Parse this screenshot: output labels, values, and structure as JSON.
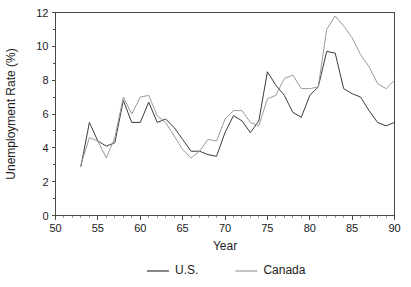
{
  "chart_data": {
    "type": "line",
    "title": "",
    "xlabel": "Year",
    "ylabel": "Unemployment Rate (%)",
    "xlim": [
      50,
      90
    ],
    "ylim": [
      0,
      12
    ],
    "xticks": [
      50,
      55,
      60,
      65,
      70,
      75,
      80,
      85,
      90
    ],
    "yticks": [
      0,
      2,
      4,
      6,
      8,
      10,
      12
    ],
    "yticks_minor": [
      1,
      3,
      5,
      7,
      9,
      11
    ],
    "grid": false,
    "legend_position": "below",
    "x": [
      53,
      54,
      55,
      56,
      57,
      58,
      59,
      60,
      61,
      62,
      63,
      64,
      65,
      66,
      67,
      68,
      69,
      70,
      71,
      72,
      73,
      74,
      75,
      76,
      77,
      78,
      79,
      80,
      81,
      82,
      83,
      84,
      85,
      86,
      87,
      88,
      89,
      90
    ],
    "series": [
      {
        "name": "U.S.",
        "color": "#3b3b3b",
        "values": [
          2.9,
          5.5,
          4.4,
          4.1,
          4.3,
          6.8,
          5.5,
          5.5,
          6.7,
          5.5,
          5.7,
          5.2,
          4.5,
          3.8,
          3.8,
          3.6,
          3.5,
          4.9,
          5.9,
          5.6,
          4.9,
          5.6,
          8.5,
          7.7,
          7.1,
          6.1,
          5.8,
          7.1,
          7.6,
          9.7,
          9.6,
          7.5,
          7.2,
          7.0,
          6.2,
          5.5,
          5.3,
          5.5
        ]
      },
      {
        "name": "Canada",
        "color": "#9a9a9a",
        "values": [
          3.0,
          4.6,
          4.4,
          3.4,
          4.6,
          7.0,
          6.0,
          7.0,
          7.1,
          5.9,
          5.5,
          4.7,
          3.9,
          3.4,
          3.8,
          4.5,
          4.4,
          5.7,
          6.2,
          6.2,
          5.5,
          5.3,
          6.9,
          7.1,
          8.1,
          8.3,
          7.5,
          7.5,
          7.6,
          11.0,
          11.8,
          11.2,
          10.5,
          9.5,
          8.8,
          7.8,
          7.5,
          8.0
        ]
      }
    ]
  },
  "legend": {
    "entries": [
      {
        "label": "U.S.",
        "color": "#3b3b3b"
      },
      {
        "label": "Canada",
        "color": "#9a9a9a"
      }
    ]
  },
  "axes": {
    "y_title": "Unemployment Rate (%)",
    "x_title": "Year",
    "y_tick_labels": [
      "0",
      "2",
      "4",
      "6",
      "8",
      "10",
      "12"
    ],
    "x_tick_labels": [
      "50",
      "55",
      "60",
      "65",
      "70",
      "75",
      "80",
      "85",
      "90"
    ]
  }
}
